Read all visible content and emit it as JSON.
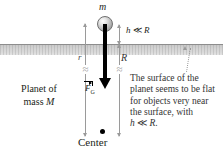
{
  "figure": {
    "type": "physics-diagram",
    "background_color": "#ffffff",
    "surface_color": "#d3d3d3",
    "arrow_color": "#000000",
    "dimension_line_color": "#9a9a9a"
  },
  "labels": {
    "mass_m": "m",
    "force_vector_symbol": "F",
    "force_vector_subscript": "G",
    "radius_r": "r",
    "radius_R": "R",
    "height_relation": "h ≪ R",
    "height_symbol": "h",
    "height_relation_operator": "≪",
    "height_relation_rhs": "R",
    "planet_line1": "Planet of",
    "planet_line2_prefix": "mass ",
    "planet_mass_symbol": "M",
    "center": "Center"
  },
  "caption": {
    "line1": "The surface of the",
    "line2": "planet seems to be",
    "line3": "flat for objects very",
    "line4": "near the surface,",
    "line5_prefix": "with ",
    "line5_symbol": "h",
    "line5_operator": " ≪ ",
    "line5_rhs": "R",
    "line5_suffix": ".",
    "full_text": "The surface of the planet seems to be flat for objects very near the surface, with h ≪ R."
  },
  "elements": {
    "sphere_name": "point-mass-m",
    "force_arrow_name": "gravitational-force-arrow",
    "surface_name": "planet-surface-band",
    "center_dot_name": "planet-center-dot",
    "r_dimension_name": "distance-r-dimension",
    "R_dimension_name": "radius-R-dimension",
    "h_dimension_name": "height-h-dimension",
    "leader_name": "caption-leader-line"
  }
}
